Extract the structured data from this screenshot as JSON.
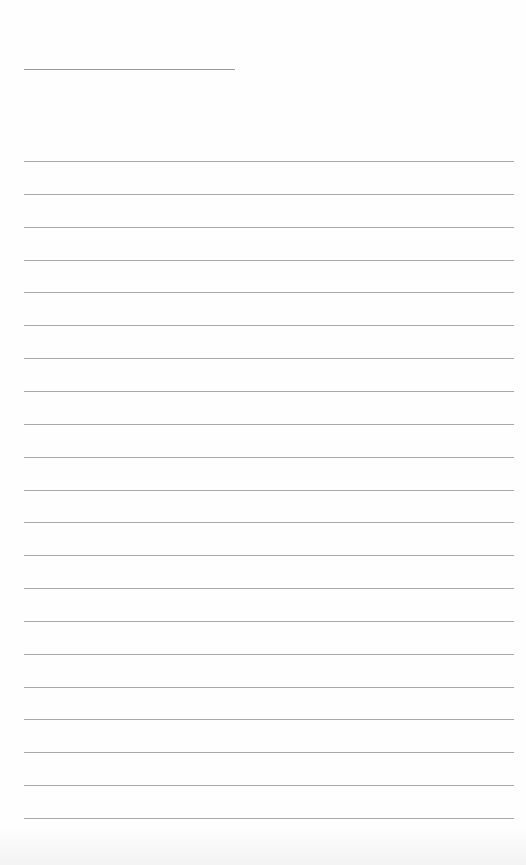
{
  "page": {
    "type": "lined-paper",
    "background_color": "#fefefe",
    "line_color": "#a8a8a8",
    "title_line": {
      "label": "",
      "color": "#9a9a9a"
    },
    "ruled_lines": {
      "count": 21,
      "spacing_px": 32.85,
      "entries": [
        "",
        "",
        "",
        "",
        "",
        "",
        "",
        "",
        "",
        "",
        "",
        "",
        "",
        "",
        "",
        "",
        "",
        "",
        "",
        "",
        ""
      ]
    }
  }
}
